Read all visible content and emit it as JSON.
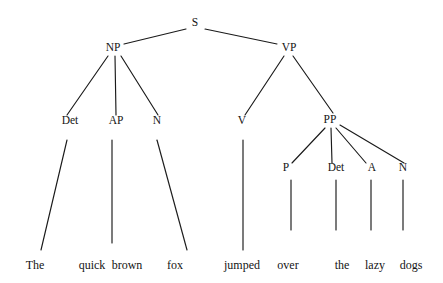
{
  "diagram": {
    "type": "syntax-parse-tree",
    "sentence": "The quick brown fox jumped over the lazy dogs",
    "ink_color": "#1a1a1a",
    "background_color": "#ffffff",
    "width": 443,
    "height": 283
  },
  "chart_data": {
    "type": "tree",
    "root": "S",
    "nodes": [
      {
        "id": "S",
        "label": "S",
        "kind": "category",
        "x": 195,
        "y": 26,
        "level": 0
      },
      {
        "id": "NP",
        "label": "NP",
        "kind": "category",
        "x": 113,
        "y": 51,
        "level": 1
      },
      {
        "id": "VP",
        "label": "VP",
        "kind": "category",
        "x": 289,
        "y": 51,
        "level": 1
      },
      {
        "id": "Det1",
        "label": "Det",
        "kind": "category",
        "x": 70,
        "y": 124,
        "level": 2
      },
      {
        "id": "AP",
        "label": "AP",
        "kind": "category",
        "x": 116,
        "y": 124,
        "level": 2
      },
      {
        "id": "N1",
        "label": "N",
        "kind": "category",
        "x": 157,
        "y": 124,
        "level": 2
      },
      {
        "id": "V",
        "label": "V",
        "kind": "category",
        "x": 242,
        "y": 124,
        "level": 2
      },
      {
        "id": "PP",
        "label": "PP",
        "kind": "category",
        "x": 330,
        "y": 123,
        "level": 2
      },
      {
        "id": "P",
        "label": "P",
        "kind": "category",
        "x": 286,
        "y": 171,
        "level": 3
      },
      {
        "id": "Det2",
        "label": "Det",
        "kind": "category",
        "x": 336,
        "y": 171,
        "level": 3
      },
      {
        "id": "A",
        "label": "A",
        "kind": "category",
        "x": 372,
        "y": 171,
        "level": 3
      },
      {
        "id": "N2",
        "label": "N",
        "kind": "category",
        "x": 403,
        "y": 171,
        "level": 3
      },
      {
        "id": "w_the1",
        "label": "The",
        "kind": "leaf",
        "x": 35,
        "y": 269,
        "level": 4
      },
      {
        "id": "w_quick",
        "label": "quick",
        "kind": "leaf",
        "x": 92,
        "y": 269,
        "level": 4
      },
      {
        "id": "w_brown",
        "label": "brown",
        "kind": "leaf",
        "x": 127,
        "y": 269,
        "level": 4
      },
      {
        "id": "w_fox",
        "label": "fox",
        "kind": "leaf",
        "x": 175,
        "y": 269,
        "level": 4
      },
      {
        "id": "w_jumped",
        "label": "jumped",
        "kind": "leaf",
        "x": 242,
        "y": 269,
        "level": 4
      },
      {
        "id": "w_over",
        "label": "over",
        "kind": "leaf",
        "x": 288,
        "y": 269,
        "level": 4
      },
      {
        "id": "w_the2",
        "label": "the",
        "kind": "leaf",
        "x": 342,
        "y": 269,
        "level": 4
      },
      {
        "id": "w_lazy",
        "label": "lazy",
        "kind": "leaf",
        "x": 375,
        "y": 269,
        "level": 4
      },
      {
        "id": "w_dogs",
        "label": "dogs",
        "kind": "leaf",
        "x": 411,
        "y": 269,
        "level": 4
      }
    ],
    "edges": [
      {
        "from": "S",
        "to": "NP",
        "x1": 186,
        "y1": 29,
        "x2": 124,
        "y2": 44
      },
      {
        "from": "S",
        "to": "VP",
        "x1": 205,
        "y1": 29,
        "x2": 277,
        "y2": 44
      },
      {
        "from": "NP",
        "to": "Det1",
        "x1": 108,
        "y1": 56,
        "x2": 67,
        "y2": 115
      },
      {
        "from": "NP",
        "to": "AP",
        "x1": 115,
        "y1": 56,
        "x2": 116,
        "y2": 115
      },
      {
        "from": "NP",
        "to": "N1",
        "x1": 121,
        "y1": 56,
        "x2": 158,
        "y2": 115
      },
      {
        "from": "VP",
        "to": "V",
        "x1": 284,
        "y1": 56,
        "x2": 245,
        "y2": 115
      },
      {
        "from": "VP",
        "to": "PP",
        "x1": 293,
        "y1": 56,
        "x2": 333,
        "y2": 113
      },
      {
        "from": "PP",
        "to": "P",
        "x1": 325,
        "y1": 128,
        "x2": 292,
        "y2": 163
      },
      {
        "from": "PP",
        "to": "Det2",
        "x1": 331,
        "y1": 128,
        "x2": 332,
        "y2": 163
      },
      {
        "from": "PP",
        "to": "A",
        "x1": 336,
        "y1": 128,
        "x2": 366,
        "y2": 163
      },
      {
        "from": "PP",
        "to": "N2",
        "x1": 340,
        "y1": 125,
        "x2": 404,
        "y2": 163
      },
      {
        "from": "Det1",
        "to": "w_the1",
        "x1": 67,
        "y1": 140,
        "x2": 41,
        "y2": 250
      },
      {
        "from": "AP",
        "to": "w_quick",
        "x1": 112,
        "y1": 140,
        "x2": 112,
        "y2": 243
      },
      {
        "from": "N1",
        "to": "w_fox",
        "x1": 157,
        "y1": 140,
        "x2": 187,
        "y2": 250
      },
      {
        "from": "V",
        "to": "w_jumped",
        "x1": 243,
        "y1": 140,
        "x2": 243,
        "y2": 250
      },
      {
        "from": "P",
        "to": "w_over",
        "x1": 291,
        "y1": 180,
        "x2": 291,
        "y2": 230
      },
      {
        "from": "Det2",
        "to": "w_the2",
        "x1": 336,
        "y1": 180,
        "x2": 336,
        "y2": 230
      },
      {
        "from": "A",
        "to": "w_lazy",
        "x1": 371,
        "y1": 180,
        "x2": 371,
        "y2": 230
      },
      {
        "from": "N2",
        "to": "w_dogs",
        "x1": 403,
        "y1": 180,
        "x2": 403,
        "y2": 230
      }
    ],
    "legend": {
      "S": "Sentence",
      "NP": "Noun Phrase",
      "VP": "Verb Phrase",
      "PP": "Prepositional Phrase",
      "AP": "Adjective Phrase",
      "Det": "Determiner",
      "N": "Noun",
      "V": "Verb",
      "P": "Preposition",
      "A": "Adjective"
    }
  }
}
